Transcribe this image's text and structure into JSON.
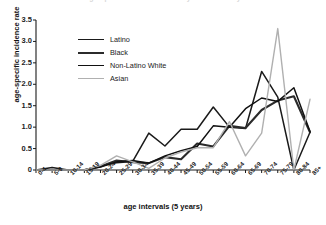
{
  "figure": {
    "clipped_title": "age-specific incidence rate by race/ethnicity"
  },
  "chart_data": {
    "type": "line",
    "title": "",
    "xlabel": "age intervals (5 years)",
    "ylabel": "age-specific incidence rate",
    "ylim": [
      0,
      3.5
    ],
    "yticks": [
      "0",
      "0.5",
      "1.0",
      "1.5",
      "2.0",
      "2.5",
      "3.0",
      "3.5"
    ],
    "ytick_values": [
      0,
      0.5,
      1.0,
      1.5,
      2.0,
      2.5,
      3.0,
      3.5
    ],
    "grid": false,
    "legend_position": "upper-left-inside",
    "categories": [
      "0-4",
      "5-9",
      "10-14",
      "15-19",
      "20-24",
      "25-29",
      "30-34",
      "35-39",
      "40-44",
      "45-49",
      "50-54",
      "55-59",
      "60-64",
      "65-69",
      "70-74",
      "75-79",
      "80-84",
      "85+"
    ],
    "series": [
      {
        "name": "Latino",
        "color": "#1a1a1a",
        "width": 1.5,
        "values": [
          0,
          0.06,
          0,
          0,
          0.1,
          0.17,
          0.2,
          0.86,
          0.56,
          0.95,
          0.95,
          1.47,
          1.0,
          0.97,
          2.3,
          1.7,
          0.0,
          0.88
        ]
      },
      {
        "name": "Black",
        "color": "#2b2b2b",
        "width": 2.1,
        "values": [
          0,
          0,
          0,
          0,
          0.08,
          0.22,
          0.18,
          0.16,
          0.3,
          0.25,
          0.62,
          0.55,
          1.03,
          0.98,
          1.4,
          1.62,
          1.72,
          0.88
        ]
      },
      {
        "name": "Non-Latino White",
        "color": "#111111",
        "width": 1.5,
        "values": [
          0,
          0,
          0,
          0,
          0.07,
          0.19,
          0.22,
          0.16,
          0.33,
          0.45,
          0.55,
          1.03,
          1.0,
          1.43,
          1.68,
          1.6,
          1.92,
          0.9
        ]
      },
      {
        "name": "Asian",
        "color": "#b0b0b0",
        "width": 1.4,
        "values": [
          0,
          0,
          0,
          0,
          0.11,
          0.33,
          0.19,
          0.04,
          0.28,
          0.42,
          0.52,
          0.52,
          1.13,
          0.33,
          0.86,
          3.3,
          0.0,
          1.65
        ]
      }
    ]
  }
}
